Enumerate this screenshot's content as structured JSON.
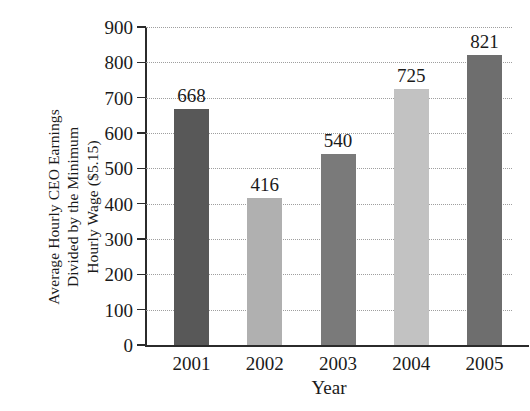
{
  "chart_data": {
    "type": "bar",
    "title": "",
    "xlabel": "Year",
    "ylabel": "Average Hourly CEO Earnings Divided by the Minimum Hourly Wage ($5.15)",
    "ylabel_lines": [
      "Average Hourly CEO Earnings",
      "Divided by the Minimum",
      "Hourly Wage ($5.15)"
    ],
    "categories": [
      "2001",
      "2002",
      "2003",
      "2004",
      "2005"
    ],
    "values": [
      668,
      416,
      540,
      725,
      821
    ],
    "value_labels": [
      "668",
      "416",
      "540",
      "725",
      "821"
    ],
    "bar_colors": [
      "#585858",
      "#b0b0b0",
      "#7a7a7a",
      "#c2c2c2",
      "#6e6e6e"
    ],
    "ylim": [
      0,
      900
    ],
    "ytick_values": [
      0,
      100,
      200,
      300,
      400,
      500,
      600,
      700,
      800,
      900
    ],
    "ytick_labels": [
      "0",
      "100",
      "200",
      "300",
      "400",
      "500",
      "600",
      "700",
      "800",
      "900"
    ],
    "grid": true,
    "grid_style": "dotted",
    "legend": false,
    "legend_position": "none",
    "axis_color": "#2b2b2b",
    "background": "#ffffff"
  }
}
